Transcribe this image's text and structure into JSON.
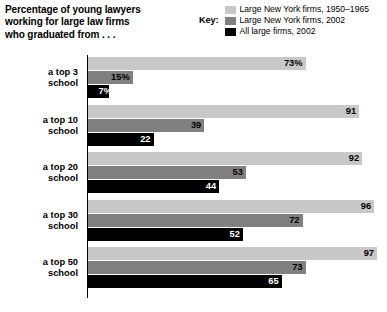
{
  "title": "Percentage of young lawyers\nworking for large law firms\nwho graduated from . . .",
  "legend": {
    "key_label": "Key:",
    "entries": [
      {
        "label": "Large New York firms, 1950–1965",
        "color": "#c8c8c8",
        "swatch_icon": "legend-swatch-light"
      },
      {
        "label": "Large New York firms, 2002",
        "color": "#808080",
        "swatch_icon": "legend-swatch-medium"
      },
      {
        "label": "All large firms, 2002",
        "color": "#000000",
        "swatch_icon": "legend-swatch-dark"
      }
    ]
  },
  "chart_data": {
    "type": "bar",
    "orientation": "horizontal",
    "title": "Percentage of young lawyers working for large law firms who graduated from . . .",
    "xlabel": "",
    "ylabel": "",
    "xlim": [
      0,
      100
    ],
    "grid": false,
    "legend_position": "top-right",
    "categories": [
      "a top 3\nschool",
      "a top 10\nschool",
      "a top 20\nschool",
      "a top 30\nschool",
      "a top 50\nschool"
    ],
    "series": [
      {
        "name": "Large New York firms, 1950–1965",
        "color": "#c8c8c8",
        "values": [
          73,
          91,
          92,
          96,
          97
        ],
        "labels": [
          "73%",
          "91",
          "92",
          "96",
          "97"
        ]
      },
      {
        "name": "Large New York firms, 2002",
        "color": "#808080",
        "values": [
          15,
          39,
          53,
          72,
          73
        ],
        "labels": [
          "15%",
          "39",
          "53",
          "72",
          "73"
        ]
      },
      {
        "name": "All large firms, 2002",
        "color": "#000000",
        "values": [
          7,
          22,
          44,
          52,
          65
        ],
        "labels": [
          "7%",
          "22",
          "44",
          "52",
          "65"
        ]
      }
    ]
  }
}
